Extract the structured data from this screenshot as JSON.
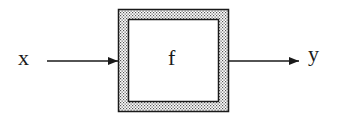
{
  "diagram": {
    "type": "block-diagram",
    "input_label": "x",
    "block_label": "f",
    "output_label": "y",
    "colors": {
      "stroke": "#1a1a1a",
      "fill_pattern": "#555555",
      "background": "#ffffff"
    }
  }
}
